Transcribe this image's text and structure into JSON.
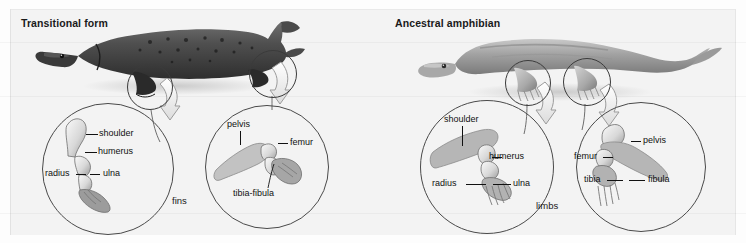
{
  "figure": {
    "panels": [
      {
        "id": "transitional",
        "title": "Transitional form",
        "caption": "fins",
        "organism": "lobe-finned-fish",
        "callouts": [
          {
            "id": "pectoral",
            "labels": [
              "shoulder",
              "humerus",
              "radius",
              "ulna"
            ]
          },
          {
            "id": "pelvic",
            "labels": [
              "pelvis",
              "femur",
              "tibia-fibula"
            ]
          }
        ]
      },
      {
        "id": "ancestral",
        "title": "Ancestral amphibian",
        "caption": "limbs",
        "organism": "amphibian",
        "callouts": [
          {
            "id": "forelimb",
            "labels": [
              "shoulder",
              "humerus",
              "radius",
              "ulna"
            ]
          },
          {
            "id": "hindlimb",
            "labels": [
              "pelvis",
              "femur",
              "tibia",
              "fibula"
            ]
          }
        ]
      }
    ],
    "labels": {
      "shoulder": "shoulder",
      "humerus": "humerus",
      "radius": "radius",
      "ulna": "ulna",
      "pelvis": "pelvis",
      "femur": "femur",
      "tibia_fibula": "tibia-fibula",
      "tibia": "tibia",
      "fibula": "fibula"
    },
    "captions": {
      "fins": "fins",
      "limbs": "limbs"
    },
    "colors": {
      "background": "#f3f3f3",
      "callout_upper": "#b4b4b4",
      "callout_lower": "#fcfcfc",
      "outline": "#4a4a4a",
      "text": "#111111"
    }
  }
}
